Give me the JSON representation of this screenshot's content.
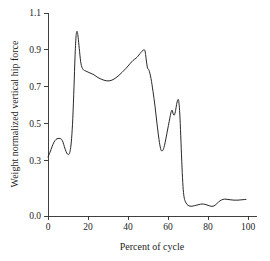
{
  "chart_data": {
    "type": "line",
    "title": "",
    "xlabel": "Percent of cycle",
    "ylabel": "Weight normalized vertical hip force",
    "xlim": [
      0,
      105
    ],
    "ylim": [
      0.0,
      1.1
    ],
    "xticks": [
      0,
      20,
      40,
      60,
      80,
      100
    ],
    "xtick_labels": [
      "0",
      "20",
      "40",
      "60",
      "80",
      "100"
    ],
    "yticks": [
      0.0,
      0.3,
      0.5,
      0.7,
      0.9,
      1.1
    ],
    "ytick_labels": [
      "0.0",
      "0.3",
      "0.5",
      "0.7",
      "0.9",
      "1.1"
    ],
    "grid": false,
    "legend": null,
    "line_color": "#1d1d1d",
    "background_color": "#ffffff",
    "series": [
      {
        "name": "Weight normalized vertical hip force",
        "x": [
          0.0,
          1.0,
          2.0,
          3.0,
          4.0,
          5.0,
          6.0,
          6.8,
          7.5,
          8.2,
          9.0,
          9.8,
          10.5,
          11.2,
          11.8,
          12.4,
          13.0,
          13.5,
          14.0,
          14.4,
          14.8,
          15.2,
          15.8,
          16.5,
          17.5,
          19.0,
          21.0,
          23.0,
          25.0,
          27.0,
          29.0,
          31.0,
          33.0,
          35.0,
          37.0,
          39.0,
          41.0,
          42.5,
          44.0,
          45.0,
          46.0,
          47.0,
          47.8,
          48.4,
          48.8,
          49.2,
          49.8,
          50.5,
          51.5,
          52.5,
          53.5,
          54.5,
          55.5,
          56.3,
          57.0,
          57.8,
          58.6,
          59.4,
          60.2,
          61.0,
          61.6,
          62.1,
          62.6,
          63.2,
          63.8,
          64.3,
          64.8,
          65.2,
          65.6,
          66.0,
          66.5,
          67.0,
          67.5,
          68.0,
          68.6,
          69.5,
          70.5,
          71.5,
          72.5,
          74.0,
          75.5,
          77.0,
          78.5,
          80.0,
          81.5,
          82.5,
          83.5,
          84.5,
          86.0,
          87.5,
          89.0,
          91.0,
          93.0,
          95.0,
          97.0,
          99.0
        ],
        "y": [
          0.32,
          0.345,
          0.375,
          0.4,
          0.415,
          0.42,
          0.42,
          0.415,
          0.4,
          0.375,
          0.35,
          0.335,
          0.335,
          0.36,
          0.42,
          0.53,
          0.7,
          0.86,
          0.97,
          1.0,
          0.99,
          0.955,
          0.89,
          0.825,
          0.795,
          0.785,
          0.775,
          0.765,
          0.75,
          0.74,
          0.733,
          0.733,
          0.742,
          0.758,
          0.778,
          0.8,
          0.825,
          0.843,
          0.855,
          0.866,
          0.88,
          0.893,
          0.9,
          0.898,
          0.875,
          0.84,
          0.8,
          0.79,
          0.745,
          0.675,
          0.595,
          0.5,
          0.415,
          0.365,
          0.352,
          0.365,
          0.4,
          0.445,
          0.49,
          0.535,
          0.565,
          0.573,
          0.553,
          0.547,
          0.572,
          0.605,
          0.627,
          0.63,
          0.6,
          0.53,
          0.4,
          0.265,
          0.16,
          0.105,
          0.08,
          0.063,
          0.055,
          0.053,
          0.054,
          0.058,
          0.062,
          0.065,
          0.063,
          0.058,
          0.053,
          0.053,
          0.058,
          0.068,
          0.082,
          0.09,
          0.091,
          0.088,
          0.086,
          0.086,
          0.088,
          0.09
        ]
      }
    ]
  },
  "axes": {
    "x_title": "Percent of cycle",
    "y_title": "Weight normalized vertical hip force"
  }
}
